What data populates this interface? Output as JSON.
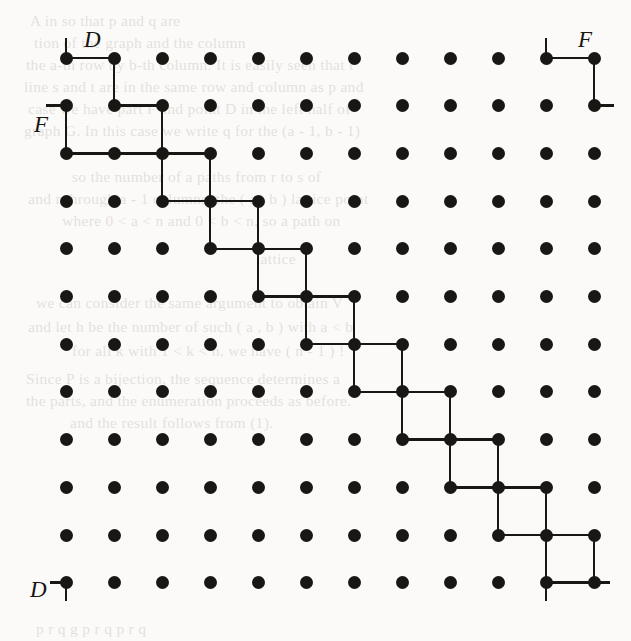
{
  "figure": {
    "type": "lattice-paths",
    "background_color": "#fbfaf8",
    "ink_color": "#191714",
    "grid": {
      "columns": 12,
      "rows": 12,
      "origin_x": 66,
      "origin_y": 58,
      "spacing_x": 48,
      "spacing_y": 47.7,
      "dot_radius": 6.5
    },
    "labels": [
      {
        "name": "label-D-top-left",
        "text": "D",
        "x": 84,
        "y": 28
      },
      {
        "name": "label-F-left",
        "text": "F",
        "x": 34,
        "y": 113
      },
      {
        "name": "label-F-top-right",
        "text": "F",
        "x": 578,
        "y": 28
      },
      {
        "name": "label-D-bottom-left",
        "text": "D",
        "x": 30,
        "y": 578
      }
    ],
    "dots": [
      [
        0,
        0
      ],
      [
        1,
        0
      ],
      [
        2,
        0
      ],
      [
        3,
        0
      ],
      [
        4,
        0
      ],
      [
        5,
        0
      ],
      [
        6,
        0
      ],
      [
        7,
        0
      ],
      [
        8,
        0
      ],
      [
        9,
        0
      ],
      [
        10,
        0
      ],
      [
        11,
        0
      ],
      [
        0,
        1
      ],
      [
        1,
        1
      ],
      [
        2,
        1
      ],
      [
        3,
        1
      ],
      [
        4,
        1
      ],
      [
        5,
        1
      ],
      [
        6,
        1
      ],
      [
        7,
        1
      ],
      [
        8,
        1
      ],
      [
        9,
        1
      ],
      [
        10,
        1
      ],
      [
        11,
        1
      ],
      [
        0,
        2
      ],
      [
        1,
        2
      ],
      [
        2,
        2
      ],
      [
        3,
        2
      ],
      [
        4,
        2
      ],
      [
        5,
        2
      ],
      [
        6,
        2
      ],
      [
        7,
        2
      ],
      [
        8,
        2
      ],
      [
        9,
        2
      ],
      [
        10,
        2
      ],
      [
        11,
        2
      ],
      [
        0,
        3
      ],
      [
        1,
        3
      ],
      [
        2,
        3
      ],
      [
        3,
        3
      ],
      [
        4,
        3
      ],
      [
        5,
        3
      ],
      [
        6,
        3
      ],
      [
        7,
        3
      ],
      [
        8,
        3
      ],
      [
        9,
        3
      ],
      [
        10,
        3
      ],
      [
        11,
        3
      ],
      [
        0,
        4
      ],
      [
        1,
        4
      ],
      [
        2,
        4
      ],
      [
        3,
        4
      ],
      [
        4,
        4
      ],
      [
        5,
        4
      ],
      [
        6,
        4
      ],
      [
        7,
        4
      ],
      [
        8,
        4
      ],
      [
        9,
        4
      ],
      [
        10,
        4
      ],
      [
        11,
        4
      ],
      [
        0,
        5
      ],
      [
        1,
        5
      ],
      [
        2,
        5
      ],
      [
        3,
        5
      ],
      [
        4,
        5
      ],
      [
        5,
        5
      ],
      [
        6,
        5
      ],
      [
        7,
        5
      ],
      [
        8,
        5
      ],
      [
        9,
        5
      ],
      [
        10,
        5
      ],
      [
        11,
        5
      ],
      [
        0,
        6
      ],
      [
        1,
        6
      ],
      [
        2,
        6
      ],
      [
        3,
        6
      ],
      [
        4,
        6
      ],
      [
        5,
        6
      ],
      [
        6,
        6
      ],
      [
        7,
        6
      ],
      [
        8,
        6
      ],
      [
        9,
        6
      ],
      [
        10,
        6
      ],
      [
        11,
        6
      ],
      [
        0,
        7
      ],
      [
        1,
        7
      ],
      [
        2,
        7
      ],
      [
        3,
        7
      ],
      [
        4,
        7
      ],
      [
        5,
        7
      ],
      [
        6,
        7
      ],
      [
        7,
        7
      ],
      [
        8,
        7
      ],
      [
        9,
        7
      ],
      [
        10,
        7
      ],
      [
        11,
        7
      ],
      [
        0,
        8
      ],
      [
        1,
        8
      ],
      [
        2,
        8
      ],
      [
        3,
        8
      ],
      [
        4,
        8
      ],
      [
        5,
        8
      ],
      [
        6,
        8
      ],
      [
        7,
        8
      ],
      [
        8,
        8
      ],
      [
        9,
        8
      ],
      [
        10,
        8
      ],
      [
        11,
        8
      ],
      [
        0,
        9
      ],
      [
        1,
        9
      ],
      [
        2,
        9
      ],
      [
        3,
        9
      ],
      [
        4,
        9
      ],
      [
        5,
        9
      ],
      [
        6,
        9
      ],
      [
        7,
        9
      ],
      [
        8,
        9
      ],
      [
        9,
        9
      ],
      [
        10,
        9
      ],
      [
        11,
        9
      ],
      [
        0,
        10
      ],
      [
        1,
        10
      ],
      [
        2,
        10
      ],
      [
        3,
        10
      ],
      [
        4,
        10
      ],
      [
        5,
        10
      ],
      [
        6,
        10
      ],
      [
        7,
        10
      ],
      [
        8,
        10
      ],
      [
        9,
        10
      ],
      [
        10,
        10
      ],
      [
        11,
        10
      ],
      [
        0,
        11
      ],
      [
        1,
        11
      ],
      [
        2,
        11
      ],
      [
        3,
        11
      ],
      [
        4,
        11
      ],
      [
        5,
        11
      ],
      [
        6,
        11
      ],
      [
        7,
        11
      ],
      [
        8,
        11
      ],
      [
        9,
        11
      ],
      [
        10,
        11
      ],
      [
        11,
        11
      ]
    ],
    "edges": [
      {
        "from": [
          0,
          0
        ],
        "to": [
          1,
          0
        ]
      },
      {
        "from": [
          1,
          0
        ],
        "to": [
          1,
          1
        ]
      },
      {
        "from": [
          1,
          1
        ],
        "to": [
          2,
          1
        ]
      },
      {
        "from": [
          2,
          1
        ],
        "to": [
          2,
          2
        ]
      },
      {
        "from": [
          0,
          2
        ],
        "to": [
          1,
          2
        ]
      },
      {
        "from": [
          1,
          2
        ],
        "to": [
          2,
          2
        ]
      },
      {
        "from": [
          2,
          2
        ],
        "to": [
          3,
          2
        ]
      },
      {
        "from": [
          0,
          1
        ],
        "to": [
          0,
          2
        ]
      },
      {
        "from": [
          2,
          2
        ],
        "to": [
          2,
          3
        ]
      },
      {
        "from": [
          2,
          3
        ],
        "to": [
          3,
          3
        ]
      },
      {
        "from": [
          3,
          2
        ],
        "to": [
          3,
          3
        ]
      },
      {
        "from": [
          3,
          3
        ],
        "to": [
          4,
          3
        ]
      },
      {
        "from": [
          3,
          3
        ],
        "to": [
          3,
          4
        ]
      },
      {
        "from": [
          3,
          4
        ],
        "to": [
          4,
          4
        ]
      },
      {
        "from": [
          4,
          3
        ],
        "to": [
          4,
          4
        ]
      },
      {
        "from": [
          4,
          4
        ],
        "to": [
          5,
          4
        ]
      },
      {
        "from": [
          4,
          4
        ],
        "to": [
          4,
          5
        ]
      },
      {
        "from": [
          4,
          5
        ],
        "to": [
          5,
          5
        ]
      },
      {
        "from": [
          5,
          4
        ],
        "to": [
          5,
          5
        ]
      },
      {
        "from": [
          5,
          5
        ],
        "to": [
          6,
          5
        ]
      },
      {
        "from": [
          5,
          5
        ],
        "to": [
          5,
          6
        ]
      },
      {
        "from": [
          5,
          6
        ],
        "to": [
          6,
          6
        ]
      },
      {
        "from": [
          6,
          5
        ],
        "to": [
          6,
          6
        ]
      },
      {
        "from": [
          6,
          6
        ],
        "to": [
          7,
          6
        ]
      },
      {
        "from": [
          6,
          6
        ],
        "to": [
          6,
          7
        ]
      },
      {
        "from": [
          6,
          7
        ],
        "to": [
          7,
          7
        ]
      },
      {
        "from": [
          7,
          6
        ],
        "to": [
          7,
          7
        ]
      },
      {
        "from": [
          7,
          7
        ],
        "to": [
          8,
          7
        ]
      },
      {
        "from": [
          7,
          7
        ],
        "to": [
          7,
          8
        ]
      },
      {
        "from": [
          7,
          8
        ],
        "to": [
          8,
          8
        ]
      },
      {
        "from": [
          8,
          7
        ],
        "to": [
          8,
          8
        ]
      },
      {
        "from": [
          8,
          8
        ],
        "to": [
          9,
          8
        ]
      },
      {
        "from": [
          8,
          8
        ],
        "to": [
          8,
          9
        ]
      },
      {
        "from": [
          8,
          9
        ],
        "to": [
          9,
          9
        ]
      },
      {
        "from": [
          9,
          8
        ],
        "to": [
          9,
          9
        ]
      },
      {
        "from": [
          9,
          9
        ],
        "to": [
          10,
          9
        ]
      },
      {
        "from": [
          9,
          9
        ],
        "to": [
          9,
          10
        ]
      },
      {
        "from": [
          9,
          10
        ],
        "to": [
          10,
          10
        ]
      },
      {
        "from": [
          10,
          9
        ],
        "to": [
          10,
          10
        ]
      },
      {
        "from": [
          10,
          10
        ],
        "to": [
          11,
          10
        ]
      },
      {
        "from": [
          10,
          10
        ],
        "to": [
          10,
          11
        ]
      },
      {
        "from": [
          10,
          11
        ],
        "to": [
          11,
          11
        ]
      },
      {
        "from": [
          11,
          10
        ],
        "to": [
          11,
          11
        ]
      },
      {
        "from": [
          10,
          0
        ],
        "to": [
          11,
          0
        ]
      },
      {
        "from": [
          11,
          0
        ],
        "to": [
          11,
          1
        ]
      }
    ],
    "stubs": [
      {
        "name": "stub-D-top-left-up",
        "at": [
          0,
          0
        ],
        "dir": "up",
        "length": 20
      },
      {
        "name": "stub-F-left-left",
        "at": [
          0,
          1
        ],
        "dir": "left",
        "length": 20
      },
      {
        "name": "stub-F-left-right",
        "at": [
          0,
          2
        ],
        "dir": "right",
        "length": 0
      },
      {
        "name": "stub-F-top-right-up",
        "at": [
          10,
          0
        ],
        "dir": "up",
        "length": 20
      },
      {
        "name": "stub-F-top-right-right",
        "at": [
          11,
          1
        ],
        "dir": "right",
        "length": 20
      },
      {
        "name": "stub-D-bottom-left-left",
        "at": [
          0,
          11
        ],
        "dir": "left",
        "length": 16
      },
      {
        "name": "stub-D-bottom-left-down",
        "at": [
          0,
          11
        ],
        "dir": "down",
        "length": 18
      },
      {
        "name": "stub-bottom-mid-down",
        "at": [
          10,
          11
        ],
        "dir": "down",
        "length": 18
      },
      {
        "name": "stub-bottom-right-right",
        "at": [
          11,
          11
        ],
        "dir": "right",
        "length": 16
      }
    ],
    "ghost_text": [
      {
        "text": "A  in                  so  that  p  and  q  are",
        "x": 30,
        "y": 12
      },
      {
        "text": "tion  of  the   graph  and  the  column",
        "x": 34,
        "y": 34
      },
      {
        "text": "the  a-th  row  by  b-th  column.  It  is  easily  seen  that  t",
        "x": 26,
        "y": 56
      },
      {
        "text": "line   s  and  t  are  in  the  same  row  and  column  as  p  and",
        "x": 24,
        "y": 78
      },
      {
        "text": "case  we  have  part  F  and  point  D  in  the  left  half  of",
        "x": 28,
        "y": 100
      },
      {
        "text": "graph  G.  In  this  case  we  write  q  for  the  (a - 1, b - 1)",
        "x": 24,
        "y": 122
      },
      {
        "text": "so  the  number  of  a  paths  from  r  to  s  of",
        "x": 72,
        "y": 168
      },
      {
        "text": "and  r  through  a  -  1  columns,  the  ( a , b )  lattice  point",
        "x": 28,
        "y": 190
      },
      {
        "text": "where  0 < a < n  and  0 < b < n,  so  a  path  on",
        "x": 62,
        "y": 212
      },
      {
        "text": "lattice",
        "x": 256,
        "y": 250
      },
      {
        "text": "we  can  consider  the  same  argument  to  obtain  V",
        "x": 36,
        "y": 294
      },
      {
        "text": "and  let  h  be  the  number  of  such  ( a , b )  with  a  <  b",
        "x": 28,
        "y": 318
      },
      {
        "text": "for  all  k  with  1 < k < n,  we  have  ( n - 1 ) !",
        "x": 72,
        "y": 342
      },
      {
        "text": "Since  P  is  a  bijection,  the  sequence  determines  a",
        "x": 26,
        "y": 370
      },
      {
        "text": "the  parts,  and  the  enumeration  proceeds  as  before.",
        "x": 26,
        "y": 392
      },
      {
        "text": "and  the  result  follows  from  (1).",
        "x": 70,
        "y": 414
      },
      {
        "text": "p       r        q        g       p       r       q       p      r       q",
        "x": 36,
        "y": 620
      }
    ]
  }
}
